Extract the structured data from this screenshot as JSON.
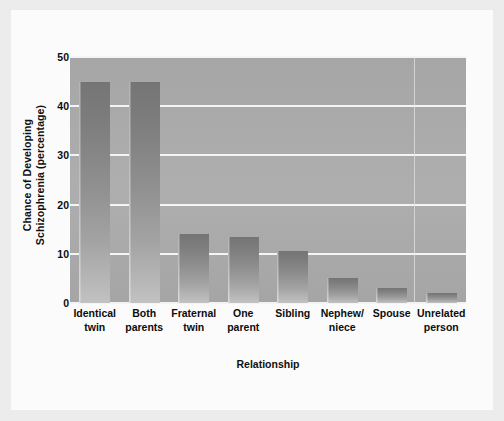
{
  "chart_data": {
    "type": "bar",
    "title": "",
    "xlabel": "Relationship",
    "ylabel": "Chance of Developing Schizophrenia (percentage)",
    "ylabel_lines": [
      "Chance of Developing",
      "Schizophrenia (percentage)"
    ],
    "categories": [
      "Identical\ntwin",
      "Both\nparents",
      "Fraternal\ntwin",
      "One\nparent",
      "Sibling",
      "Nephew/\nniece",
      "Spouse",
      "Unrelated\nperson"
    ],
    "values": [
      45,
      45,
      14,
      13.5,
      10.5,
      5,
      3,
      2
    ],
    "ylim": [
      0,
      50
    ],
    "yticks": [
      0,
      10,
      20,
      30,
      40,
      50
    ],
    "ytick_labels": [
      "0",
      "10",
      "20",
      "30",
      "40",
      "50"
    ],
    "grid": "horizontal",
    "legend": "none",
    "bar_color": "#8e8e8e",
    "plot_background": "#a9a9a9",
    "gridline_color": "#f4f4f4",
    "figure_background": "#fbfbfb",
    "canvas_background": "#ececed"
  }
}
